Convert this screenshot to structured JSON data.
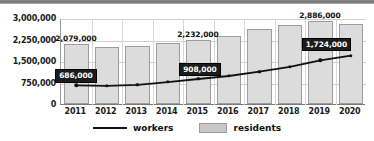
{
  "chart_data": {
    "type": "bar",
    "title": "",
    "xlabel": "",
    "ylabel": "",
    "categories": [
      "2011",
      "2012",
      "2013",
      "2014",
      "2015",
      "2016",
      "2017",
      "2018",
      "2019",
      "2020"
    ],
    "ylim": [
      0,
      3000000
    ],
    "yticks": [
      0,
      750000,
      1500000,
      2250000,
      3000000
    ],
    "ytick_labels": [
      "0",
      "750,000",
      "1,500,000",
      "2,250,000",
      "3,000,000"
    ],
    "grid": true,
    "legend_position": "bottom",
    "series": [
      {
        "name": "residents",
        "type": "bar",
        "color": "#dcdcdc",
        "values": [
          2079000,
          2000000,
          2020000,
          2130000,
          2232000,
          2370000,
          2620000,
          2760000,
          2886000,
          2780000
        ],
        "data_labels": [
          {
            "category": "2011",
            "value": 2079000,
            "text": "2,079,000"
          },
          {
            "category": "2015",
            "value": 2232000,
            "text": "2,232,000"
          },
          {
            "category": "2019",
            "value": 2886000,
            "text": "2,886,000"
          }
        ]
      },
      {
        "name": "workers",
        "type": "line",
        "color": "#111111",
        "values": [
          686000,
          670000,
          700000,
          800000,
          908000,
          1010000,
          1160000,
          1330000,
          1560000,
          1724000
        ],
        "data_labels": [
          {
            "category": "2011",
            "value": 686000,
            "text": "686,000"
          },
          {
            "category": "2015",
            "value": 908000,
            "text": "908,000"
          },
          {
            "category": "2020",
            "value": 1724000,
            "text": "1,724,000"
          }
        ]
      }
    ]
  },
  "legend": {
    "workers_label": "workers",
    "residents_label": "residents"
  },
  "colors": {
    "bar_fill": "#dcdcdc",
    "bar_stroke": "#9d9d9d",
    "line": "#111111",
    "callout_bg": "#1c1c1c",
    "callout_text": "#ffffff",
    "grid": "#cfcfcf",
    "axis": "#7a7a7a",
    "top_band": "#6f6f6f"
  }
}
